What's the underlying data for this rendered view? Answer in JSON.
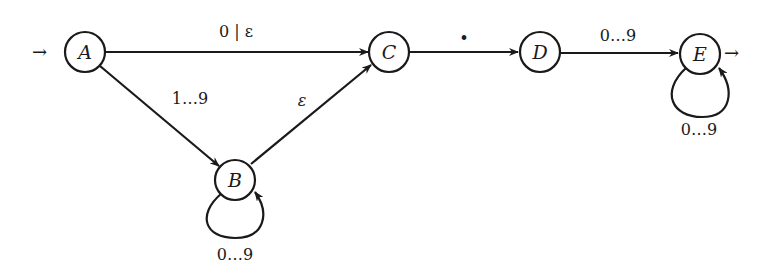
{
  "diagram": {
    "type": "finite-state-automaton",
    "nodes": [
      {
        "id": "A",
        "label": "A",
        "start": true
      },
      {
        "id": "B",
        "label": "B"
      },
      {
        "id": "C",
        "label": "C"
      },
      {
        "id": "D",
        "label": "D"
      },
      {
        "id": "E",
        "label": "E",
        "accepting": true
      }
    ],
    "edges": [
      {
        "from": "A",
        "to": "C",
        "label": "0 | ε"
      },
      {
        "from": "A",
        "to": "B",
        "label": "1…9"
      },
      {
        "from": "B",
        "to": "B",
        "label": "0…9"
      },
      {
        "from": "B",
        "to": "C",
        "label": "ε"
      },
      {
        "from": "C",
        "to": "D",
        "label": "•"
      },
      {
        "from": "D",
        "to": "E",
        "label": "0…9"
      },
      {
        "from": "E",
        "to": "E",
        "label": "0…9"
      }
    ],
    "start_arrow": "→",
    "accept_arrow": "→"
  }
}
